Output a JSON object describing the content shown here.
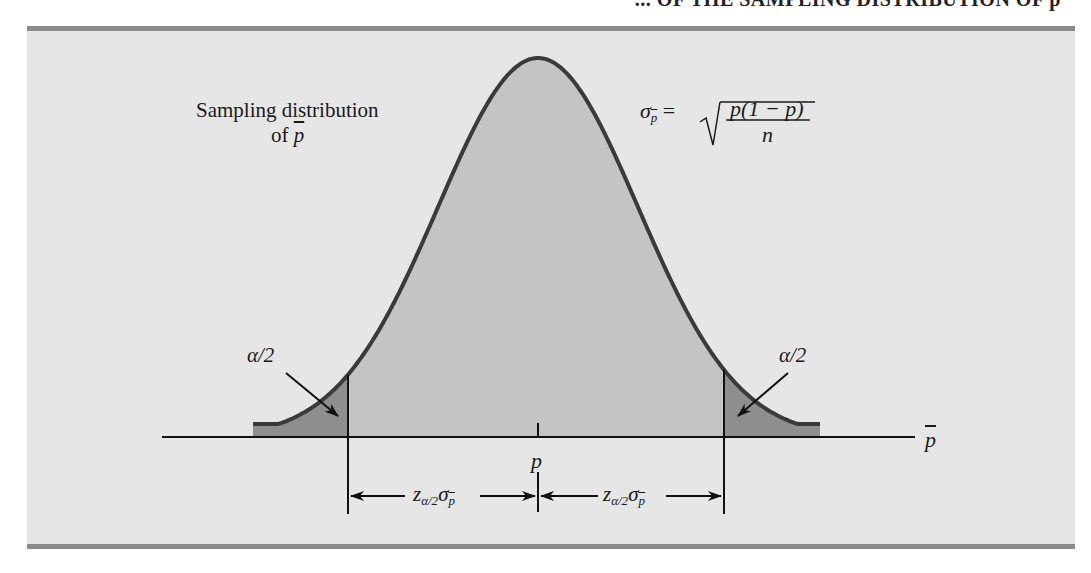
{
  "title": {
    "text": "FIGURE 8.6 NORMAL APPROXIMATION OF THE SAMPLING DISTRIBUTION OF p̄",
    "visible_fragment": "... OF THE SAMPLING DISTRIBUTION OF p̄"
  },
  "labels": {
    "sampling_line1": "Sampling distribution",
    "sampling_line2_prefix": "of ",
    "sampling_var": "p",
    "sigma": "σ",
    "sigma_sub": "p",
    "equals": "=",
    "numerator": "p(1 − p)",
    "denominator": "n",
    "alpha_left": "α/2",
    "alpha_right": "α/2",
    "center_label": "p",
    "axis_label": "p",
    "margin_left_z": "z",
    "margin_left_sub": "α/2",
    "margin_left_sigma": "σ",
    "margin_left_sigma_sub": "p",
    "margin_right_z": "z",
    "margin_right_sub": "α/2",
    "margin_right_sigma": "σ",
    "margin_right_sigma_sub": "p"
  },
  "colors": {
    "background": "#e6e6e6",
    "body_fill": "#c4c4c4",
    "tail_fill": "#8e8e8e",
    "curve_stroke": "#3a3a3a",
    "rule": "#8a8a8a"
  },
  "chart_data": {
    "type": "area",
    "xlabel": "p̄",
    "ylabel": "",
    "center": "p",
    "distribution": "normal",
    "standard_error_formula": "σ_p̄ = sqrt(p(1 − p)/n)",
    "shaded_regions": [
      {
        "name": "lower tail",
        "area": "α/2"
      },
      {
        "name": "middle",
        "area": "1 − α"
      },
      {
        "name": "upper tail",
        "area": "α/2"
      }
    ],
    "interval": {
      "lower": "p − z_{α/2}σ_p̄",
      "upper": "p + z_{α/2}σ_p̄"
    },
    "grid": false
  }
}
